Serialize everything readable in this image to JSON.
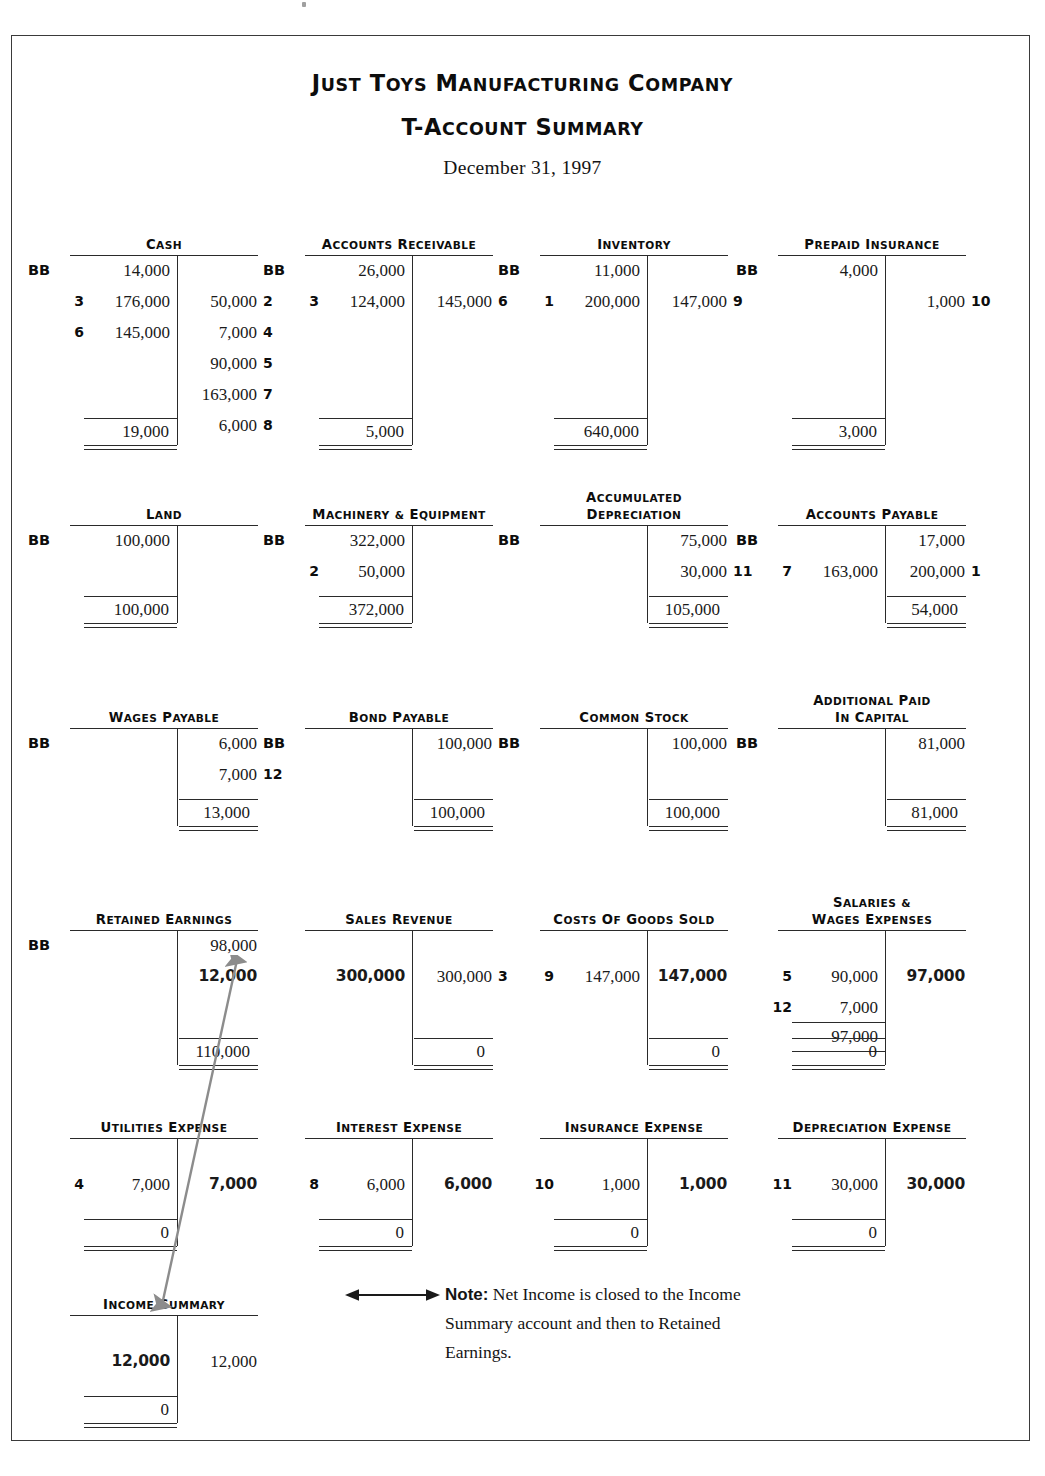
{
  "header": {
    "company": "Just Toys Manufacturing Company",
    "statement": "T-Account Summary",
    "date": "December 31, 1997"
  },
  "labels": {
    "bb": "BB"
  },
  "note": {
    "prefix": "Note:",
    "text": " Net Income is closed to the Income Summary account and then to Retained Earnings.",
    "arrow_icon": "double-headed-arrow"
  },
  "accounts": [
    {
      "id": "cash",
      "title": "Cash",
      "bb_side": "left",
      "bb_amount": "14,000",
      "left": [
        {
          "ref": "3",
          "amt": "176,000"
        },
        {
          "ref": "6",
          "amt": "145,000"
        }
      ],
      "right": [
        {
          "ref": "2",
          "amt": "50,000"
        },
        {
          "ref": "4",
          "amt": "7,000"
        },
        {
          "ref": "5",
          "amt": "90,000"
        },
        {
          "ref": "7",
          "amt": "163,000"
        },
        {
          "ref": "8",
          "amt": "6,000"
        }
      ],
      "balance": "19,000",
      "balance_side": "left"
    },
    {
      "id": "accounts-receivable",
      "title": "Accounts Receivable",
      "bb_side": "left",
      "bb_amount": "26,000",
      "left": [
        {
          "ref": "3",
          "amt": "124,000"
        }
      ],
      "right": [
        {
          "ref": "6",
          "amt": "145,000"
        }
      ],
      "balance": "5,000",
      "balance_side": "left"
    },
    {
      "id": "inventory",
      "title": "Inventory",
      "bb_side": "left",
      "bb_amount": "11,000",
      "left": [
        {
          "ref": "1",
          "amt": "200,000"
        }
      ],
      "right": [
        {
          "ref": "9",
          "amt": "147,000"
        }
      ],
      "balance": "640,000",
      "balance_side": "left"
    },
    {
      "id": "prepaid-insurance",
      "title": "Prepaid Insurance",
      "bb_side": "left",
      "bb_amount": "4,000",
      "left": [],
      "right": [
        {
          "ref": "10",
          "amt": "1,000"
        }
      ],
      "balance": "3,000",
      "balance_side": "left"
    },
    {
      "id": "land",
      "title": "Land",
      "bb_side": "left",
      "bb_amount": "100,000",
      "left": [],
      "right": [],
      "balance": "100,000",
      "balance_side": "left"
    },
    {
      "id": "machinery-equipment",
      "title": "Machinery & Equipment",
      "bb_side": "left",
      "bb_amount": "322,000",
      "left": [
        {
          "ref": "2",
          "amt": "50,000"
        }
      ],
      "right": [],
      "balance": "372,000",
      "balance_side": "left"
    },
    {
      "id": "accumulated-depreciation",
      "title_line1": "Accumulated",
      "title_line2": "Depreciation",
      "title": "Accumulated Depreciation",
      "bb_side": "right",
      "bb_amount": "75,000",
      "left": [],
      "right": [
        {
          "ref": "11",
          "amt": "30,000"
        }
      ],
      "balance": "105,000",
      "balance_side": "right"
    },
    {
      "id": "accounts-payable",
      "title": "Accounts Payable",
      "bb_side": "right",
      "bb_amount": "17,000",
      "left": [
        {
          "ref": "7",
          "amt": "163,000"
        }
      ],
      "right": [
        {
          "ref": "1",
          "amt": "200,000"
        }
      ],
      "balance": "54,000",
      "balance_side": "right"
    },
    {
      "id": "wages-payable",
      "title": "Wages Payable",
      "bb_side": "right",
      "bb_amount": "6,000",
      "left": [],
      "right": [
        {
          "ref": "12",
          "amt": "7,000"
        }
      ],
      "balance": "13,000",
      "balance_side": "right"
    },
    {
      "id": "bond-payable",
      "title": "Bond Payable",
      "bb_side": "right",
      "bb_amount": "100,000",
      "left": [],
      "right": [],
      "balance": "100,000",
      "balance_side": "right"
    },
    {
      "id": "common-stock",
      "title": "Common Stock",
      "bb_side": "right",
      "bb_amount": "100,000",
      "left": [],
      "right": [],
      "balance": "100,000",
      "balance_side": "right"
    },
    {
      "id": "additional-paid-in-capital",
      "title_line1": "Additional Paid",
      "title_line2": "in Capital",
      "title": "Additional Paid in Capital",
      "bb_side": "right",
      "bb_amount": "81,000",
      "left": [],
      "right": [],
      "balance": "81,000",
      "balance_side": "right"
    },
    {
      "id": "retained-earnings",
      "title": "Retained Earnings",
      "bb_side": "right",
      "bb_amount": "98,000",
      "left": [],
      "right": [
        {
          "ref": "",
          "amt": "12,000",
          "bold": true
        }
      ],
      "balance": "110,000",
      "balance_side": "right"
    },
    {
      "id": "sales-revenue",
      "title": "Sales Revenue",
      "left": [
        {
          "ref": "",
          "amt": "300,000",
          "bold": true
        }
      ],
      "right": [
        {
          "ref": "3",
          "amt": "300,000"
        }
      ],
      "balance": "0",
      "balance_side": "right"
    },
    {
      "id": "costs-of-goods-sold",
      "title": "Costs of Goods Sold",
      "left": [
        {
          "ref": "9",
          "amt": "147,000"
        }
      ],
      "right": [
        {
          "ref": "",
          "amt": "147,000",
          "bold": true
        }
      ],
      "balance": "0",
      "balance_side": "right"
    },
    {
      "id": "salaries-wages-expenses",
      "title_line1": "Salaries &",
      "title_line2": "Wages Expenses",
      "title": "Salaries & Wages Expenses",
      "left": [
        {
          "ref": "5",
          "amt": "90,000"
        },
        {
          "ref": "12",
          "amt": "7,000"
        }
      ],
      "subtotal_left": "97,000",
      "right": [
        {
          "ref": "",
          "amt": "97,000",
          "bold": true
        }
      ],
      "balance": "0",
      "balance_side": "left"
    },
    {
      "id": "utilities-expense",
      "title": "Utilities Expense",
      "left": [
        {
          "ref": "4",
          "amt": "7,000"
        }
      ],
      "right": [
        {
          "ref": "",
          "amt": "7,000",
          "bold": true
        }
      ],
      "balance": "0",
      "balance_side": "left"
    },
    {
      "id": "interest-expense",
      "title": "Interest Expense",
      "left": [
        {
          "ref": "8",
          "amt": "6,000"
        }
      ],
      "right": [
        {
          "ref": "",
          "amt": "6,000",
          "bold": true
        }
      ],
      "balance": "0",
      "balance_side": "left"
    },
    {
      "id": "insurance-expense",
      "title": "Insurance Expense",
      "left": [
        {
          "ref": "10",
          "amt": "1,000"
        }
      ],
      "right": [
        {
          "ref": "",
          "amt": "1,000",
          "bold": true
        }
      ],
      "balance": "0",
      "balance_side": "left"
    },
    {
      "id": "depreciation-expense",
      "title": "Depreciation Expense",
      "left": [
        {
          "ref": "11",
          "amt": "30,000"
        }
      ],
      "right": [
        {
          "ref": "",
          "amt": "30,000",
          "bold": true
        }
      ],
      "balance": "0",
      "balance_side": "left"
    },
    {
      "id": "income-summary",
      "title": "Income Summary",
      "left": [
        {
          "ref": "",
          "amt": "12,000",
          "bold": true
        }
      ],
      "right": [
        {
          "ref": "",
          "amt": "12,000"
        }
      ],
      "balance": "0",
      "balance_side": "left"
    }
  ]
}
